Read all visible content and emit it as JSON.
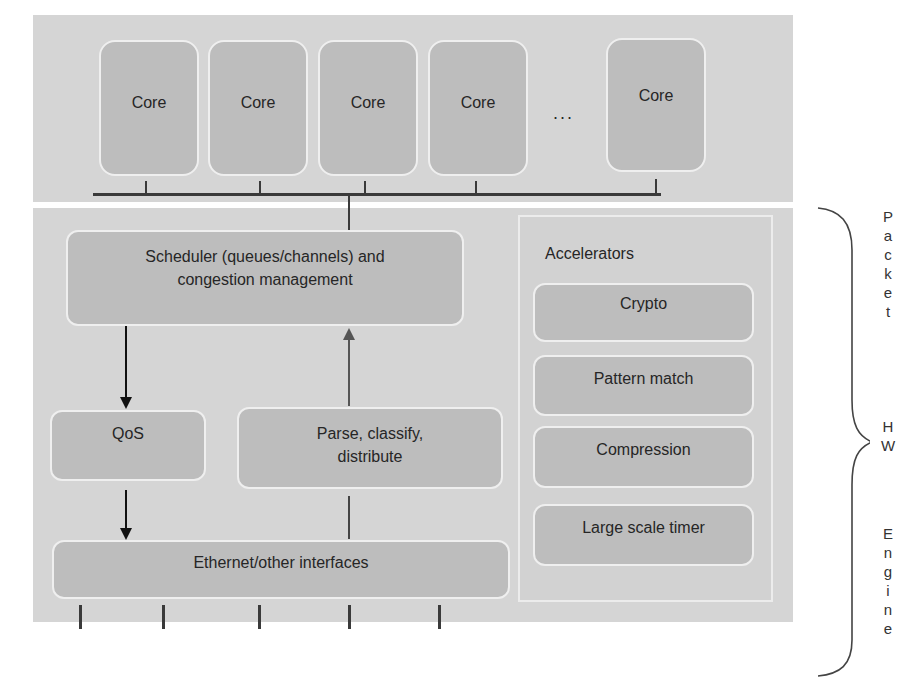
{
  "cores": {
    "items": [
      {
        "label": "Core"
      },
      {
        "label": "Core"
      },
      {
        "label": "Core"
      },
      {
        "label": "Core"
      },
      {
        "label": "Core"
      }
    ],
    "ellipsis": "..."
  },
  "engine": {
    "scheduler": {
      "line1": "Scheduler (queues/channels) and",
      "line2": "congestion management"
    },
    "qos": {
      "label": "QoS"
    },
    "parse": {
      "line1": "Parse, classify,",
      "line2": "distribute"
    },
    "ethernet": {
      "label": "Ethernet/other interfaces"
    }
  },
  "accelerators": {
    "title": "Accelerators",
    "items": [
      {
        "label": "Crypto"
      },
      {
        "label": "Pattern match"
      },
      {
        "label": "Compression"
      },
      {
        "label": "Large scale timer"
      }
    ]
  },
  "brace_label": {
    "word1": [
      "P",
      "a",
      "c",
      "k",
      "e",
      "t"
    ],
    "word2": [
      "H",
      "W"
    ],
    "word3": [
      "E",
      "n",
      "g",
      "i",
      "n",
      "e"
    ],
    "full": "Packet HW Engine"
  },
  "colors": {
    "panel": "#d5d5d5",
    "box": "#bdbdbd",
    "box_border": "#efefef",
    "line": "#3a3a3a"
  }
}
